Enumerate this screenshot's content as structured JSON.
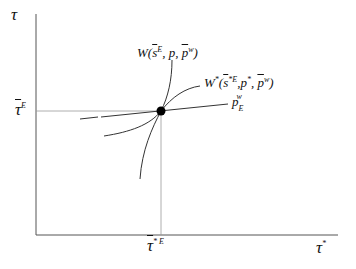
{
  "diagram": {
    "axes": {
      "y_label": "τ",
      "x_label": "τ",
      "x_label_sup": "*"
    },
    "reference_points": {
      "y_tick_label": "τ",
      "y_tick_sup": "E",
      "x_tick_label": "τ",
      "x_tick_sup": "* E"
    },
    "curves": [
      {
        "id": "W",
        "label_main": "W(",
        "label_s": "s",
        "label_s_sup": "E",
        "label_rest": ", p, ",
        "label_p": "p",
        "label_p_sup": "w",
        "label_close": ")"
      },
      {
        "id": "W_star",
        "label_main": "W",
        "label_main_sup": "*",
        "label_open": "(",
        "label_s": "s",
        "label_s_sup": "*E",
        "label_rest": ",p",
        "label_rest_sup": "*",
        "label_comma": ", ",
        "label_p": "p",
        "label_p_sup": "w",
        "label_close": ")"
      },
      {
        "id": "p_E_w",
        "label_main": "p",
        "label_sub": "E",
        "label_sup": "w"
      }
    ],
    "equilibrium_point": {
      "x": 161,
      "y": 111
    },
    "colors": {
      "line": "#333333",
      "guide": "#888888",
      "dot": "#000000"
    }
  }
}
